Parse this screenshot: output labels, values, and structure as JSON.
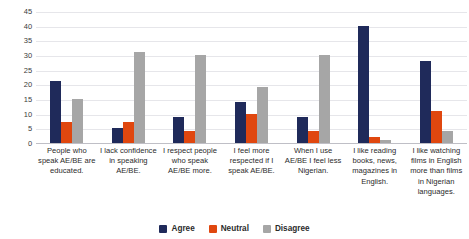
{
  "chart_data": {
    "type": "bar",
    "title": "",
    "xlabel": "",
    "ylabel": "",
    "ylim": [
      0,
      45
    ],
    "yticks": [
      0,
      5,
      10,
      15,
      20,
      25,
      30,
      35,
      40,
      45
    ],
    "grid": true,
    "legend_position": "bottom",
    "categories": [
      "People who speak AE/BE are educated.",
      "I lack confidence in speaking AE/BE.",
      "I respect people who speak AE/BE more.",
      "I feel more respected if I speak AE/BE.",
      "When I use AE/BE I feel less Nigerian.",
      "I like reading books, news, magazines in English.",
      "I like watching films in English more than films in Nigerian languages."
    ],
    "series": [
      {
        "name": "Agree",
        "color": "#1f2a5a",
        "values": [
          21,
          5,
          9,
          14,
          9,
          40,
          28
        ]
      },
      {
        "name": "Neutral",
        "color": "#e0470f",
        "values": [
          7,
          7,
          4,
          10,
          4,
          2,
          11
        ]
      },
      {
        "name": "Disagree",
        "color": "#a6a6a6",
        "values": [
          15,
          31,
          30,
          19,
          30,
          1,
          4
        ]
      }
    ]
  },
  "legend": {
    "items": [
      {
        "label": "Agree",
        "color": "#1f2a5a"
      },
      {
        "label": "Neutral",
        "color": "#e0470f"
      },
      {
        "label": "Disagree",
        "color": "#a6a6a6"
      }
    ]
  }
}
